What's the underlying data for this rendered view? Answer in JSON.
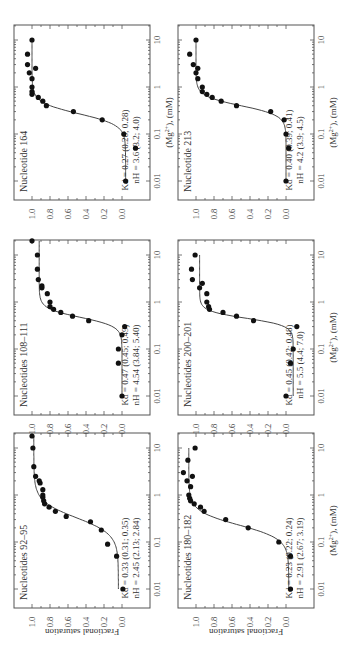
{
  "chart_data": [
    {
      "type": "scatter",
      "title": "Nucleotide 164",
      "xlabel": "(Mg2+), (mM)",
      "ylabel": "",
      "xscale": "log",
      "xlim": [
        0.01,
        10
      ],
      "ylim": [
        0.0,
        1.0
      ],
      "annotation": {
        "kd": "K_d = 0.27 (0.26; 0.28)",
        "nh": "n_H = 3.6 (3.2; 4.0)"
      },
      "fit": {
        "kd": 0.27,
        "n": 3.6,
        "bottom": -0.04,
        "top": 1.0
      },
      "x": [
        0.01,
        0.05,
        0.1,
        0.2,
        0.3,
        0.4,
        0.5,
        0.6,
        0.7,
        0.8,
        1.0,
        1.5,
        2.0,
        2.5,
        3.0,
        5.0,
        10
      ],
      "y": [
        -0.04,
        -0.15,
        -0.02,
        0.22,
        0.54,
        0.84,
        0.88,
        0.93,
        1.0,
        1.0,
        1.0,
        1.0,
        1.03,
        0.96,
        1.05,
        1.05,
        1.0
      ]
    },
    {
      "type": "scatter",
      "title": "Nucleotide 213",
      "xlabel": "(Mg2+), (mM)",
      "ylabel": "",
      "xscale": "log",
      "xlim": [
        0.01,
        10
      ],
      "ylim": [
        0.0,
        1.0
      ],
      "annotation": {
        "kd": "K_d = 0.40 (0.39; 0.41)",
        "nh": "n_H = 4.2 (3.9; 4.5)"
      },
      "fit": {
        "kd": 0.4,
        "n": 4.2,
        "bottom": 0.0,
        "top": 1.0
      },
      "x": [
        0.01,
        0.05,
        0.1,
        0.2,
        0.3,
        0.4,
        0.5,
        0.6,
        0.7,
        0.8,
        1.0,
        1.5,
        2.0,
        2.5,
        3.0,
        5.0,
        10
      ],
      "y": [
        0.0,
        -0.03,
        0.0,
        0.02,
        0.17,
        0.55,
        0.72,
        0.82,
        0.88,
        0.93,
        0.93,
        0.98,
        1.0,
        0.98,
        1.03,
        1.07,
        1.0
      ]
    },
    {
      "type": "scatter",
      "title": "Nucleotides 108–111",
      "xlabel": "",
      "ylabel": "",
      "xscale": "log",
      "xlim": [
        0.01,
        10
      ],
      "ylim": [
        0.0,
        1.0
      ],
      "annotation": {
        "kd": "K_d = 0.47 (0.45; 0.49)",
        "nh": "n_H = 4.54 (3.84; 5.40)"
      },
      "fit": {
        "kd": 0.47,
        "n": 4.54,
        "bottom": 0.0,
        "top": 0.92
      },
      "x": [
        0.01,
        0.05,
        0.1,
        0.2,
        0.3,
        0.4,
        0.5,
        0.6,
        0.7,
        0.8,
        1.0,
        1.5,
        2.0,
        2.2,
        3.0,
        5.0,
        10,
        20
      ],
      "y": [
        0.0,
        0.04,
        0.04,
        0.0,
        -0.03,
        0.37,
        0.55,
        0.68,
        0.76,
        0.8,
        0.8,
        0.83,
        0.89,
        0.89,
        0.93,
        0.94,
        0.94,
        1.0
      ]
    },
    {
      "type": "scatter",
      "title": "Nucleotides 200–201",
      "xlabel": "(Mg2+), (mM)",
      "ylabel": "",
      "xscale": "log",
      "xlim": [
        0.01,
        10
      ],
      "ylim": [
        0.0,
        1.0
      ],
      "annotation": {
        "kd": "K_d = 0.45 (0.42; 0.48)",
        "nh": "n_H = 5.5 (4.4; 7.0)"
      },
      "fit": {
        "kd": 0.45,
        "n": 5.5,
        "bottom": -0.08,
        "top": 0.96
      },
      "x": [
        0.01,
        0.05,
        0.1,
        0.3,
        0.4,
        0.5,
        0.6,
        0.7,
        0.8,
        1.0,
        1.5,
        2.0,
        2.5,
        3.0,
        5.0,
        10
      ],
      "y": [
        0.0,
        -0.05,
        -0.08,
        -0.12,
        0.36,
        0.55,
        0.7,
        0.85,
        0.86,
        0.88,
        0.88,
        0.96,
        0.93,
        1.04,
        1.05,
        1.01
      ]
    },
    {
      "type": "scatter",
      "title": "Nucleotides 92–95",
      "xlabel": "",
      "ylabel": "Fractional saturation",
      "xscale": "log",
      "xlim": [
        0.01,
        10
      ],
      "ylim": [
        0.0,
        1.0
      ],
      "annotation": {
        "kd": "K_d = 0.33 (0.31; 0.35)",
        "nh": "n_H = 2.45 (2.13; 2.84)"
      },
      "fit": {
        "kd": 0.33,
        "n": 2.45,
        "bottom": 0.04,
        "top": 0.98
      },
      "x": [
        0.01,
        0.05,
        0.09,
        0.18,
        0.27,
        0.35,
        0.45,
        0.55,
        0.65,
        0.75,
        0.9,
        1.0,
        1.3,
        1.8,
        2.0,
        2.5,
        4.0,
        10,
        18
      ],
      "y": [
        -0.01,
        0.06,
        0.16,
        0.23,
        0.35,
        0.62,
        0.74,
        0.81,
        0.86,
        0.87,
        0.88,
        0.88,
        0.88,
        0.91,
        0.92,
        0.96,
        0.98,
        0.99,
        1.0
      ]
    },
    {
      "type": "scatter",
      "title": "Nucleotides 180–182",
      "xlabel": "(Mg2+), (mM)",
      "ylabel": "Fractional saturation",
      "xscale": "log",
      "xlim": [
        0.01,
        10
      ],
      "ylim": [
        0.0,
        1.0
      ],
      "annotation": {
        "kd": "K_d = 0.23 (0.22; 0.24)",
        "nh": "n_H = 2.91 (2.67; 3.19)"
      },
      "fit": {
        "kd": 0.23,
        "n": 2.91,
        "bottom": -0.03,
        "top": 1.08
      },
      "x": [
        0.01,
        0.05,
        0.1,
        0.2,
        0.3,
        0.45,
        0.55,
        0.65,
        0.75,
        0.85,
        1.0,
        1.5,
        2.0,
        2.5,
        3.0,
        5.5,
        10
      ],
      "y": [
        -0.05,
        -0.05,
        0.08,
        0.42,
        0.67,
        0.91,
        0.95,
        1.02,
        1.06,
        1.07,
        1.08,
        1.06,
        1.1,
        1.04,
        1.14,
        1.09,
        1.01
      ]
    }
  ],
  "axes": {
    "x_ticks": [
      "0.01",
      "0.1",
      "1",
      "10"
    ],
    "y_ticks": [
      "0.0",
      "0.2",
      "0.4",
      "0.6",
      "0.8",
      "1.0"
    ],
    "xlabel": "(Mg2+), (mM)",
    "ylabel": "Fractional saturation"
  },
  "layout": {
    "rotation_deg": -90,
    "panels_screen": [
      {
        "index": 0,
        "fx": 14,
        "fy": 25,
        "show_xlabel": true,
        "show_ylabel": false
      },
      {
        "index": 1,
        "fx": 178,
        "fy": 25,
        "show_xlabel": true,
        "show_ylabel": false
      },
      {
        "index": 2,
        "fx": 14,
        "fy": 240,
        "show_xlabel": false,
        "show_ylabel": false
      },
      {
        "index": 3,
        "fx": 178,
        "fy": 240,
        "show_xlabel": true,
        "show_ylabel": false
      },
      {
        "index": 4,
        "fx": 14,
        "fy": 433,
        "show_xlabel": false,
        "show_ylabel": true
      },
      {
        "index": 5,
        "fx": 178,
        "fy": 433,
        "show_xlabel": true,
        "show_ylabel": true
      }
    ]
  }
}
